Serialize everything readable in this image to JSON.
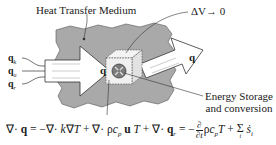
{
  "diagram": {
    "medium_label": "Heat Transfer Medium",
    "volume_label": "ΔV→ 0",
    "flux_inputs": [
      {
        "symbol": "q",
        "subscript": "k"
      },
      {
        "symbol": "q",
        "subscript": "u"
      },
      {
        "symbol": "q",
        "subscript": "r"
      }
    ],
    "arrow_in_label": "q",
    "arrow_out_label": "q",
    "storage_label_line1": "Energy Storage",
    "storage_label_line2": "and conversion",
    "colors": {
      "medium_fill": "#a9a9a9",
      "arrow_fill": "#ffffff",
      "outline": "#333333",
      "cube_dash": "#555555",
      "source_fill": "#7a7a7a"
    }
  },
  "equation": {
    "lhs": "∇· q",
    "terms": [
      "= −∇· k∇T",
      "+ ∇· ρc_p u T",
      "+ ∇· q_r",
      "= −(∂/∂t) ρc_p T",
      "+ Σ_i ṡ_i"
    ]
  }
}
